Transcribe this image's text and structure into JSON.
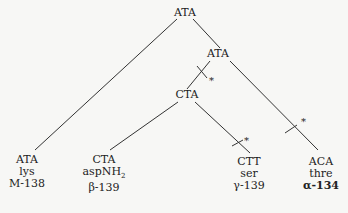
{
  "diagram": {
    "type": "phylogenetic-tree",
    "nodes": {
      "root": {
        "label": "ATA"
      },
      "mid": {
        "label": "ATA"
      },
      "inner": {
        "label": "CTA"
      }
    },
    "leaves": [
      {
        "codon": "ATA",
        "amino_acid": "lys",
        "id": "M-138"
      },
      {
        "codon": "CTA",
        "amino_acid": "aspNH",
        "amino_acid_sub": "2",
        "id": "β-139"
      },
      {
        "codon": "CTT",
        "amino_acid": "ser",
        "id": "γ-139"
      },
      {
        "codon": "ACA",
        "amino_acid": "thre",
        "id": "α-134"
      }
    ],
    "mutation_marker": "*",
    "line_color": "#333333"
  }
}
